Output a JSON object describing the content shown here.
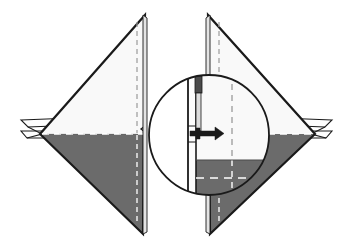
{
  "figure": {
    "background_color": "#ffffff",
    "width": 351,
    "height": 249
  },
  "palette": {
    "paper_front": "#f9f9f9",
    "paper_back_shaded": "#6b6b6b",
    "outline": "#1a1a1a",
    "fold_line_dashed_light": "#f2f2f2",
    "fold_line_dashed_dark": "#9a9a9a",
    "pin_head": "#4a4a4a",
    "pin_body": "#dcdcdc",
    "detail_circle_fill": "#ffffff"
  },
  "panels": [
    {
      "name": "left-panel",
      "label": "Left mirrored fold panel",
      "apex_top": {
        "x": 145,
        "y": 15
      },
      "apex_bottom": {
        "x": 143,
        "y": 234
      },
      "hinge_left": {
        "x": 40,
        "y": 134
      },
      "fold_line_y": 134,
      "center_dash_x": 137,
      "upper_region": "unshaded front face",
      "lower_region": "shaded reverse face",
      "clamp": {
        "name": "left-clamp-bracket",
        "x": 20,
        "y": 118,
        "width": 30,
        "height": 20,
        "orientation": "points-left"
      }
    },
    {
      "name": "right-panel",
      "label": "Right mirrored fold panel",
      "apex_top": {
        "x": 208,
        "y": 15
      },
      "apex_bottom": {
        "x": 210,
        "y": 234
      },
      "hinge_right": {
        "x": 315,
        "y": 134
      },
      "fold_line_y": 134,
      "center_dash_x": 219,
      "upper_region": "unshaded front face",
      "lower_region": "shaded reverse face",
      "clamp": {
        "name": "right-clamp-bracket",
        "x": 303,
        "y": 118,
        "width": 30,
        "height": 20,
        "orientation": "points-right"
      }
    }
  ],
  "detail_view": {
    "name": "magnified-detail-circle",
    "label": "Magnified detail of seam and pin",
    "center": {
      "x": 209,
      "y": 135
    },
    "radius": 60,
    "contents": [
      "vertical seam edge",
      "pin shaft with dark head",
      "arrowhead insertion indicator",
      "shaded lower reverse face",
      "horizontal dashed fold line",
      "vertical dashed center line"
    ],
    "pin": {
      "name": "pin-fastener",
      "head_x": 195,
      "head_y": 76,
      "head_width": 7,
      "head_height": 17,
      "shaft_height": 38
    },
    "arrow": {
      "name": "insertion-arrow",
      "tip_x": 220,
      "tip_y": 133,
      "tail_x": 196,
      "tail_y": 133,
      "direction": "right"
    }
  },
  "annotations": {
    "fold_line_style": "dashed",
    "hidden_edge_style": "dashed",
    "shading_meaning": "reverse side of sheet",
    "detail_callout": "circular magnifier"
  }
}
